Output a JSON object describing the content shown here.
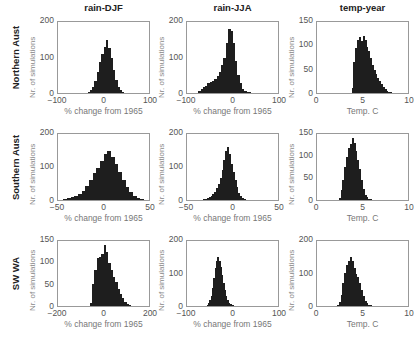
{
  "columns": [
    {
      "title": "rain-DJF"
    },
    {
      "title": "rain-JJA"
    },
    {
      "title": "temp-year"
    }
  ],
  "rows": [
    {
      "label": "Northern Aust"
    },
    {
      "label": "Southern Aust"
    },
    {
      "label": "SW WA"
    }
  ],
  "chart_data": [
    {
      "type": "bar",
      "title": "rain-DJF",
      "row": "Northern Aust",
      "xlabel": "% change from 1965",
      "ylabel": "Nr. of simulations",
      "xlim": [
        -100,
        100
      ],
      "ylim": [
        0,
        200
      ],
      "xticks": [
        -100,
        0,
        100
      ],
      "yticks": [
        0,
        100,
        200
      ],
      "bin_width": 5,
      "bin_starts": [
        -35,
        -30,
        -25,
        -20,
        -15,
        -10,
        -5,
        0,
        5,
        10,
        15,
        20,
        25,
        30,
        35,
        40,
        45
      ],
      "values": [
        3,
        8,
        18,
        35,
        58,
        88,
        110,
        130,
        150,
        128,
        98,
        65,
        38,
        18,
        8,
        3,
        1
      ]
    },
    {
      "type": "bar",
      "title": "rain-JJA",
      "row": "Northern Aust",
      "xlabel": "% change from 1965",
      "ylabel": "Nr. of simulations",
      "xlim": [
        -100,
        100
      ],
      "ylim": [
        0,
        200
      ],
      "xticks": [
        -100,
        0,
        100
      ],
      "yticks": [
        0,
        100,
        200
      ],
      "bin_width": 5,
      "bin_starts": [
        -75,
        -70,
        -65,
        -60,
        -55,
        -50,
        -45,
        -40,
        -35,
        -30,
        -25,
        -20,
        -15,
        -10,
        -5,
        0,
        5,
        10,
        15,
        20,
        25,
        30,
        35,
        40,
        45
      ],
      "values": [
        5,
        12,
        18,
        20,
        28,
        32,
        35,
        40,
        48,
        58,
        78,
        98,
        140,
        180,
        175,
        140,
        90,
        50,
        28,
        12,
        5,
        3,
        2,
        1,
        1
      ]
    },
    {
      "type": "bar",
      "title": "temp-year",
      "row": "Northern Aust",
      "xlabel": "Temp. C",
      "ylabel": "Nr. of simulations",
      "xlim": [
        0,
        10
      ],
      "ylim": [
        0,
        150
      ],
      "xticks": [
        0,
        5,
        10
      ],
      "yticks": [
        0,
        50,
        100,
        150
      ],
      "bin_width": 0.2,
      "bin_starts": [
        3.8,
        4.0,
        4.2,
        4.4,
        4.6,
        4.8,
        5.0,
        5.2,
        5.4,
        5.6,
        5.8,
        6.0,
        6.2,
        6.4,
        6.6,
        6.8,
        7.0,
        7.2,
        7.4,
        7.6,
        7.8,
        8.0
      ],
      "values": [
        10,
        65,
        95,
        112,
        118,
        110,
        120,
        112,
        98,
        88,
        74,
        60,
        48,
        40,
        32,
        25,
        18,
        12,
        8,
        5,
        3,
        2
      ]
    },
    {
      "type": "bar",
      "title": "rain-DJF",
      "row": "Southern Aust",
      "xlabel": "% change from 1965",
      "ylabel": "Nr. of simulations",
      "xlim": [
        -50,
        50
      ],
      "ylim": [
        0,
        200
      ],
      "xticks": [
        -50,
        0,
        50
      ],
      "yticks": [
        0,
        100,
        200
      ],
      "bin_width": 4,
      "bin_starts": [
        -48,
        -44,
        -40,
        -36,
        -32,
        -28,
        -24,
        -20,
        -16,
        -12,
        -8,
        -4,
        0,
        4,
        8,
        12,
        16,
        20,
        24,
        28,
        32,
        36,
        40,
        44
      ],
      "values": [
        1,
        2,
        5,
        8,
        12,
        18,
        28,
        42,
        62,
        82,
        98,
        118,
        140,
        148,
        130,
        108,
        85,
        62,
        40,
        25,
        12,
        6,
        3,
        1
      ]
    },
    {
      "type": "bar",
      "title": "rain-JJA",
      "row": "Southern Aust",
      "xlabel": "% change from 1965",
      "ylabel": "Nr. of simulations",
      "xlim": [
        -50,
        50
      ],
      "ylim": [
        0,
        200
      ],
      "xticks": [
        -50,
        0,
        50
      ],
      "yticks": [
        0,
        100,
        200
      ],
      "bin_width": 2,
      "bin_starts": [
        -34,
        -32,
        -30,
        -28,
        -26,
        -24,
        -22,
        -20,
        -18,
        -16,
        -14,
        -12,
        -10,
        -8,
        -6,
        -4,
        -2,
        0,
        2,
        4,
        6,
        8,
        10,
        12,
        14
      ],
      "values": [
        1,
        2,
        3,
        5,
        8,
        12,
        18,
        25,
        35,
        50,
        68,
        90,
        120,
        148,
        162,
        140,
        110,
        85,
        60,
        38,
        22,
        12,
        6,
        3,
        1
      ]
    },
    {
      "type": "bar",
      "title": "temp-year",
      "row": "Southern Aust",
      "xlabel": "Temp. C",
      "ylabel": "Nr. of simulations",
      "xlim": [
        0,
        10
      ],
      "ylim": [
        0,
        150
      ],
      "xticks": [
        0,
        5,
        10
      ],
      "yticks": [
        0,
        50,
        100,
        150
      ],
      "bin_width": 0.2,
      "bin_starts": [
        2.4,
        2.6,
        2.8,
        3.0,
        3.2,
        3.4,
        3.6,
        3.8,
        4.0,
        4.2,
        4.4,
        4.6,
        4.8,
        5.0,
        5.2,
        5.4,
        5.6,
        5.8,
        6.0
      ],
      "values": [
        5,
        22,
        45,
        75,
        98,
        118,
        128,
        142,
        130,
        112,
        92,
        70,
        45,
        25,
        12,
        6,
        3,
        2,
        1
      ]
    },
    {
      "type": "bar",
      "title": "rain-DJF",
      "row": "SW WA",
      "xlabel": "% change from 1965",
      "ylabel": "Nr. of simulations",
      "xlim": [
        -200,
        200
      ],
      "ylim": [
        0,
        150
      ],
      "xticks": [
        -200,
        0,
        200
      ],
      "yticks": [
        0,
        50,
        100,
        150
      ],
      "bin_width": 10,
      "bin_starts": [
        -60,
        -50,
        -40,
        -30,
        -20,
        -10,
        0,
        10,
        20,
        30,
        40,
        50,
        60,
        70,
        80,
        90,
        100,
        110
      ],
      "values": [
        8,
        50,
        82,
        110,
        112,
        120,
        140,
        125,
        100,
        82,
        68,
        55,
        40,
        28,
        18,
        10,
        4,
        2
      ]
    },
    {
      "type": "bar",
      "title": "rain-JJA",
      "row": "SW WA",
      "xlabel": "% change from 1965",
      "ylabel": "Nr. of simulations",
      "xlim": [
        -100,
        100
      ],
      "ylim": [
        0,
        200
      ],
      "xticks": [
        -100,
        0,
        100
      ],
      "yticks": [
        0,
        100,
        200
      ],
      "bin_width": 3,
      "bin_starts": [
        -57,
        -54,
        -51,
        -48,
        -45,
        -42,
        -39,
        -36,
        -33,
        -30,
        -27,
        -24,
        -21,
        -18,
        -15,
        -12,
        -9,
        -6,
        -3,
        0,
        3
      ],
      "values": [
        3,
        8,
        18,
        32,
        55,
        85,
        118,
        138,
        152,
        140,
        120,
        95,
        70,
        48,
        30,
        18,
        10,
        5,
        3,
        2,
        1
      ]
    },
    {
      "type": "bar",
      "title": "temp-year",
      "row": "SW WA",
      "xlabel": "Temp. C",
      "ylabel": "Nr. of simulations",
      "xlim": [
        0,
        10
      ],
      "ylim": [
        0,
        200
      ],
      "xticks": [
        0,
        5,
        10
      ],
      "yticks": [
        0,
        100,
        200
      ],
      "bin_width": 0.2,
      "bin_starts": [
        2.2,
        2.4,
        2.6,
        2.8,
        3.0,
        3.2,
        3.4,
        3.6,
        3.8,
        4.0,
        4.2,
        4.4,
        4.6,
        4.8,
        5.0,
        5.2,
        5.4,
        5.6,
        5.8,
        6.0,
        6.2
      ],
      "values": [
        3,
        12,
        35,
        70,
        102,
        125,
        140,
        152,
        138,
        118,
        98,
        88,
        70,
        50,
        30,
        16,
        8,
        4,
        2,
        1,
        1
      ]
    }
  ]
}
